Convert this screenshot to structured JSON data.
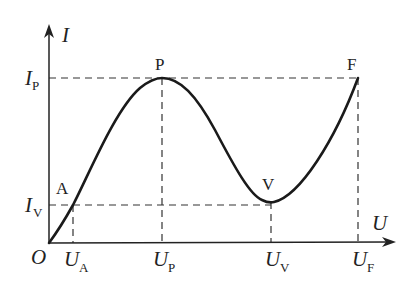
{
  "diagram": {
    "type": "I-U characteristic curve (N-shaped / negative resistance)",
    "axes": {
      "y_label": "I",
      "x_label": "U",
      "origin_label": "O"
    },
    "points": {
      "A": {
        "label": "A"
      },
      "P": {
        "label": "P"
      },
      "V": {
        "label": "V"
      },
      "F": {
        "label": "F"
      }
    },
    "y_ticks": {
      "IP": {
        "main": "I",
        "sub": "P"
      },
      "IV": {
        "main": "I",
        "sub": "V"
      }
    },
    "x_ticks": {
      "UA": {
        "main": "U",
        "sub": "A"
      },
      "UP": {
        "main": "U",
        "sub": "P"
      },
      "UV": {
        "main": "U",
        "sub": "V"
      },
      "UF": {
        "main": "U",
        "sub": "F"
      }
    },
    "colors": {
      "ink": "#222222",
      "background": "#ffffff"
    }
  }
}
